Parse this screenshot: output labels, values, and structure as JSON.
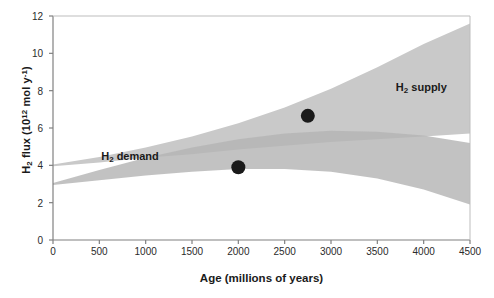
{
  "chart_data": {
    "type": "area",
    "title": "",
    "xlabel": "Age (millions of years)",
    "ylabel_plain": "H2 flux (10^12 mol y^-1)",
    "ylabel_parts": {
      "lead": "H",
      "sub1": "2",
      "mid": " flux (10",
      "sup1": "12",
      "mid2": " mol y",
      "sup2": "-1",
      "tail": ")"
    },
    "xlim": [
      0,
      4500
    ],
    "ylim": [
      0,
      12
    ],
    "xticks": [
      "0",
      "500",
      "1000",
      "1500",
      "2000",
      "2500",
      "3000",
      "3500",
      "4000",
      "4500"
    ],
    "yticks": [
      "0",
      "2",
      "4",
      "6",
      "8",
      "10",
      "12"
    ],
    "grid": false,
    "legend_position": "inline-annotations",
    "series": [
      {
        "name": "H2 supply",
        "kind": "band",
        "color": "#c9c9c9",
        "x": [
          0,
          500,
          1000,
          1500,
          2000,
          2500,
          3000,
          3500,
          4000,
          4500
        ],
        "upper": [
          4.05,
          4.45,
          4.95,
          5.55,
          6.25,
          7.1,
          8.1,
          9.25,
          10.5,
          11.6
        ],
        "lower": [
          3.95,
          4.15,
          4.4,
          4.6,
          4.85,
          5.05,
          5.25,
          5.4,
          5.55,
          5.7
        ]
      },
      {
        "name": "H2 demand",
        "kind": "band",
        "color": "#b4b4b4",
        "x": [
          0,
          500,
          1000,
          1500,
          2000,
          2500,
          3000,
          3500,
          4000,
          4500
        ],
        "upper": [
          3.05,
          3.75,
          4.4,
          4.95,
          5.4,
          5.7,
          5.85,
          5.8,
          5.6,
          5.2
        ],
        "lower": [
          2.95,
          3.2,
          3.45,
          3.65,
          3.8,
          3.8,
          3.65,
          3.3,
          2.7,
          1.9
        ]
      }
    ],
    "points": [
      {
        "label": "",
        "x": 2000,
        "y": 3.9,
        "color": "#1a1a1a",
        "radius": 7
      },
      {
        "label": "",
        "x": 2750,
        "y": 6.65,
        "color": "#1a1a1a",
        "radius": 7
      }
    ],
    "annotations": [
      {
        "name": "h2-demand-label",
        "text_parts": {
          "lead": "H",
          "sub": "2",
          "tail": " demand"
        },
        "x": 520,
        "y": 4.3
      },
      {
        "name": "h2-supply-label",
        "text_parts": {
          "lead": "H",
          "sub": "2",
          "tail": " supply"
        },
        "x": 3700,
        "y": 8.0
      }
    ],
    "colors": {
      "supply_band": "#c9c9c9",
      "demand_band": "#b4b4b4",
      "overlap": "#a8a8a8",
      "axis": "#808080",
      "point": "#1a1a1a",
      "text": "#1a1a1a",
      "background": "#ffffff"
    }
  }
}
